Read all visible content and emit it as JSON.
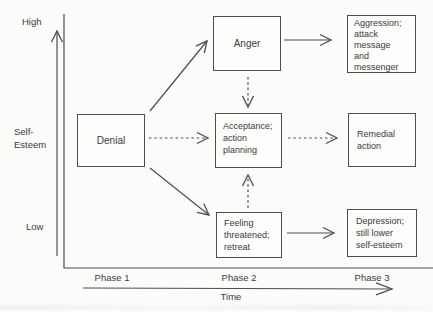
{
  "colors": {
    "ink": "#4d4d4d",
    "text": "#3b3b3b",
    "background": "#fcfcfb"
  },
  "diagram": {
    "y_axis": {
      "top_label": "High",
      "axis_title": "Self-\nEsteem",
      "bottom_label": "Low"
    },
    "x_axis": {
      "ticks": [
        "Phase 1",
        "Phase 2",
        "Phase 3"
      ],
      "title": "Time"
    },
    "nodes": {
      "denial": "Denial",
      "anger": "Anger",
      "acceptance": "Acceptance;\naction\nplanning",
      "feeling_threatened": "Feeling\nthreatened;\nretreat",
      "aggression": "Aggression;\nattack\nmessage\nand\nmessenger",
      "remedial": "Remedial\naction",
      "depression": "Depression;\nstill lower\nself-esteem"
    },
    "edges": [
      {
        "from": "denial",
        "to": "anger",
        "style": "solid"
      },
      {
        "from": "denial",
        "to": "acceptance",
        "style": "dashed"
      },
      {
        "from": "denial",
        "to": "feeling_threatened",
        "style": "solid"
      },
      {
        "from": "anger",
        "to": "aggression",
        "style": "solid"
      },
      {
        "from": "anger",
        "to": "acceptance",
        "style": "dashed"
      },
      {
        "from": "acceptance",
        "to": "remedial",
        "style": "dashed"
      },
      {
        "from": "feeling_threatened",
        "to": "acceptance",
        "style": "dashed"
      },
      {
        "from": "feeling_threatened",
        "to": "depression",
        "style": "solid"
      }
    ]
  }
}
